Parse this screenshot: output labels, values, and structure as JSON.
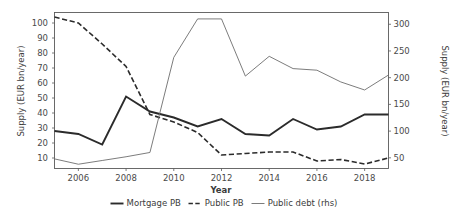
{
  "chart_data": {
    "type": "line",
    "title": "",
    "xlabel": "Year",
    "ylabel": "Supply (EUR bn/year)",
    "ylabel_right": "Supply (EUR bn/year)",
    "grid": false,
    "legend_position": "bottom",
    "x": [
      2005,
      2006,
      2007,
      2008,
      2009,
      2010,
      2011,
      2012,
      2013,
      2014,
      2015,
      2016,
      2017,
      2018,
      2019
    ],
    "xlim": [
      2005,
      2019
    ],
    "ylim": [
      3,
      107
    ],
    "ylim_right": [
      30,
      322
    ],
    "xticks": [
      2006,
      2008,
      2010,
      2012,
      2014,
      2016,
      2018
    ],
    "xticklabels": [
      "2006",
      "2008",
      "2010",
      "2012",
      "2014",
      "2016",
      "2018"
    ],
    "yticks": [
      10,
      20,
      30,
      40,
      50,
      60,
      70,
      80,
      90,
      100
    ],
    "yticklabels": [
      "10",
      "20",
      "30",
      "40",
      "50",
      "60",
      "70",
      "80",
      "90",
      "100"
    ],
    "yticks_right": [
      50,
      100,
      150,
      200,
      250,
      300
    ],
    "yticklabels_right": [
      "50",
      "100",
      "150",
      "200",
      "250",
      "300"
    ],
    "series": [
      {
        "name": "Mortgage PB",
        "axis": "left",
        "style": "solid",
        "width": 1.9,
        "color": "#2b2b2b",
        "values": [
          28,
          26,
          19,
          51,
          41,
          37,
          31,
          36,
          26,
          25,
          36,
          29,
          31,
          39,
          39
        ]
      },
      {
        "name": "Public PB",
        "axis": "left",
        "style": "dashed",
        "width": 1.6,
        "color": "#2b2b2b",
        "values": [
          104,
          100,
          86,
          71,
          39,
          34,
          27,
          12,
          13,
          14,
          14,
          8,
          9,
          6,
          10
        ]
      },
      {
        "name": "Public debt (rhs)",
        "axis": "right",
        "style": "solid",
        "width": 0.9,
        "color": "#6d6d6d",
        "values": [
          48,
          38,
          45,
          52,
          60,
          238,
          310,
          310,
          203,
          240,
          217,
          214,
          192,
          177,
          205
        ]
      }
    ]
  },
  "legend": {
    "entries": [
      {
        "label": "Mortgage PB",
        "style": "solid-thick"
      },
      {
        "label": "Public PB",
        "style": "dashed"
      },
      {
        "label": "Public debt (rhs)",
        "style": "solid-thin"
      }
    ]
  },
  "axes": {
    "x_title": "Year",
    "y_left_title": "Supply (EUR bn/year)",
    "y_right_title": "Supply (EUR bn/year)"
  }
}
